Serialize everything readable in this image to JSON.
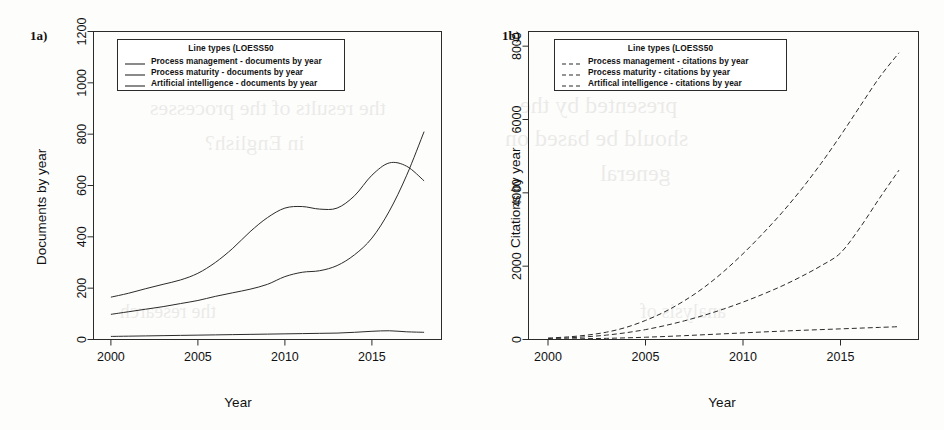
{
  "figure": {
    "panels": [
      {
        "tag": "1a)",
        "legend_title": "Line types (LOESS50",
        "xlabel": "Year",
        "ylabel": "Documents by year"
      },
      {
        "tag": "1b)",
        "legend_title": "Line types (LOESS50",
        "xlabel": "Year",
        "ylabel": "Citations by year"
      }
    ]
  },
  "chart_data": [
    {
      "type": "line",
      "panel": "1a)",
      "title": "",
      "xlabel": "Year",
      "ylabel": "Documents by year",
      "xlim": [
        1999,
        2019
      ],
      "ylim": [
        0,
        1200
      ],
      "xticks": [
        2000,
        2005,
        2010,
        2015
      ],
      "yticks": [
        0,
        200,
        400,
        600,
        800,
        1000,
        1200
      ],
      "grid": false,
      "legend_title": "Line types (LOESS50",
      "legend_position": "top-left-inside",
      "x": [
        2000,
        2001,
        2002,
        2003,
        2004,
        2005,
        2006,
        2007,
        2008,
        2009,
        2010,
        2011,
        2012,
        2013,
        2014,
        2015,
        2016,
        2017,
        2018
      ],
      "series": [
        {
          "name": "Process management - documents by year",
          "linestyle": "solid",
          "values": [
            165,
            180,
            198,
            215,
            232,
            258,
            300,
            355,
            420,
            475,
            512,
            518,
            508,
            512,
            560,
            640,
            688,
            675,
            618
          ]
        },
        {
          "name": "Process maturity - documents by year",
          "linestyle": "solid",
          "values": [
            98,
            108,
            118,
            128,
            140,
            152,
            168,
            182,
            196,
            215,
            245,
            262,
            268,
            288,
            330,
            395,
            500,
            640,
            810
          ]
        },
        {
          "name": "Artificial intelligence - documents by year",
          "linestyle": "solid",
          "values": [
            12,
            13,
            14,
            15,
            16,
            17,
            18,
            19,
            20,
            21,
            22,
            23,
            24,
            25,
            28,
            32,
            34,
            30,
            28
          ]
        }
      ],
      "note": "The steeply rising near-vertical solid line reaching ~1030 at 2018 is the Process maturity series; it crosses the Process management curve near 2016-2017."
    },
    {
      "type": "line",
      "panel": "1b)",
      "title": "",
      "xlabel": "Year",
      "ylabel": "Citations by year",
      "xlim": [
        1999,
        2019
      ],
      "ylim": [
        0,
        8400
      ],
      "xticks": [
        2000,
        2005,
        2010,
        2015
      ],
      "yticks": [
        0,
        2000,
        4000,
        6000,
        8000
      ],
      "grid": false,
      "legend_title": "Line types (LOESS50",
      "legend_position": "top-left-inside",
      "x": [
        2000,
        2001,
        2002,
        2003,
        2004,
        2005,
        2006,
        2007,
        2008,
        2009,
        2010,
        2011,
        2012,
        2013,
        2014,
        2015,
        2016,
        2017,
        2018
      ],
      "series": [
        {
          "name": "Process management - citations by year",
          "linestyle": "dashed",
          "values": [
            40,
            70,
            120,
            200,
            330,
            520,
            760,
            1060,
            1420,
            1850,
            2340,
            2880,
            3460,
            4100,
            4800,
            5560,
            6360,
            7150,
            7820
          ]
        },
        {
          "name": "Process maturity - citations by year",
          "linestyle": "dashed",
          "values": [
            25,
            45,
            75,
            120,
            185,
            270,
            380,
            510,
            660,
            830,
            1020,
            1230,
            1460,
            1720,
            2010,
            2360,
            3050,
            3850,
            4620
          ]
        },
        {
          "name": "Artifical intelligence - citations by year",
          "linestyle": "dashed",
          "values": [
            10,
            15,
            22,
            32,
            45,
            62,
            82,
            105,
            130,
            155,
            180,
            205,
            228,
            250,
            270,
            290,
            310,
            330,
            350
          ]
        }
      ]
    }
  ],
  "ghost_text": [
    {
      "text": "the results of the processes",
      "x": 150,
      "y": 95,
      "size": 22
    },
    {
      "text": "in English?",
      "x": 205,
      "y": 130,
      "size": 22
    },
    {
      "text": "presented by the",
      "x": 520,
      "y": 92,
      "size": 24
    },
    {
      "text": "should be based on",
      "x": 505,
      "y": 125,
      "size": 24
    },
    {
      "text": "general",
      "x": 600,
      "y": 160,
      "size": 24
    },
    {
      "text": "the research",
      "x": 120,
      "y": 300,
      "size": 20
    },
    {
      "text": "analysis of",
      "x": 640,
      "y": 300,
      "size": 20
    }
  ]
}
